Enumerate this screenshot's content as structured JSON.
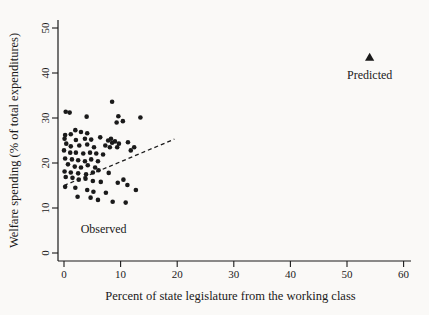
{
  "colors": {
    "background": "#faf9f7",
    "ink": "#1a1a1a"
  },
  "chart_data": {
    "type": "scatter",
    "title": "",
    "xlabel": "Percent of state legislature from the working class",
    "ylabel": "Welfare spending (% of total expenditures)",
    "xlim": [
      0,
      62
    ],
    "ylim": [
      0,
      52
    ],
    "x_ticks": [
      0,
      10,
      20,
      30,
      40,
      50,
      60
    ],
    "y_ticks": [
      0,
      10,
      20,
      30,
      40,
      50
    ],
    "grid": false,
    "legend_position": "none",
    "series": [
      {
        "name": "Observed",
        "marker": "circle",
        "color": "#1a1a1a",
        "points": [
          [
            8.5,
            33.6
          ],
          [
            13.5,
            30.1
          ],
          [
            0.3,
            31.4
          ],
          [
            1.0,
            31.2
          ],
          [
            4.0,
            30.3
          ],
          [
            9.6,
            30.4
          ],
          [
            10.4,
            29.3
          ],
          [
            9.3,
            29.0
          ],
          [
            2.0,
            27.3
          ],
          [
            3.0,
            26.9
          ],
          [
            0.2,
            26.2
          ],
          [
            1.2,
            26.4
          ],
          [
            4.1,
            26.6
          ],
          [
            0.1,
            25.4
          ],
          [
            2.1,
            25.1
          ],
          [
            3.7,
            25.4
          ],
          [
            4.8,
            25.2
          ],
          [
            6.4,
            25.7
          ],
          [
            8.3,
            25.4
          ],
          [
            9.0,
            24.8
          ],
          [
            7.8,
            25.0
          ],
          [
            8.5,
            24.5
          ],
          [
            9.7,
            24.3
          ],
          [
            11.3,
            24.6
          ],
          [
            12.4,
            23.5
          ],
          [
            11.8,
            22.8
          ],
          [
            0.4,
            24.3
          ],
          [
            1.2,
            23.7
          ],
          [
            2.7,
            23.9
          ],
          [
            4.1,
            24.1
          ],
          [
            5.3,
            23.5
          ],
          [
            7.3,
            23.9
          ],
          [
            8.1,
            23.5
          ],
          [
            9.4,
            23.5
          ],
          [
            0.0,
            22.8
          ],
          [
            1.1,
            22.3
          ],
          [
            2.1,
            22.3
          ],
          [
            3.4,
            22.1
          ],
          [
            4.6,
            22.3
          ],
          [
            5.7,
            22.1
          ],
          [
            6.9,
            21.9
          ],
          [
            0.2,
            21.0
          ],
          [
            1.4,
            20.8
          ],
          [
            2.5,
            20.6
          ],
          [
            3.7,
            20.4
          ],
          [
            4.8,
            20.8
          ],
          [
            6.0,
            20.4
          ],
          [
            0.7,
            19.7
          ],
          [
            1.9,
            19.2
          ],
          [
            3.0,
            19.0
          ],
          [
            4.2,
            19.5
          ],
          [
            5.5,
            19.0
          ],
          [
            0.1,
            18.1
          ],
          [
            1.2,
            17.9
          ],
          [
            2.5,
            17.7
          ],
          [
            3.9,
            17.5
          ],
          [
            5.1,
            17.9
          ],
          [
            6.1,
            18.4
          ],
          [
            7.9,
            17.8
          ],
          [
            0.3,
            16.9
          ],
          [
            1.5,
            16.7
          ],
          [
            2.6,
            16.3
          ],
          [
            3.8,
            16.5
          ],
          [
            5.1,
            16.0
          ],
          [
            6.5,
            15.8
          ],
          [
            9.5,
            15.6
          ],
          [
            10.5,
            16.3
          ],
          [
            11.2,
            15.1
          ],
          [
            0.2,
            14.7
          ],
          [
            2.0,
            14.5
          ],
          [
            4.1,
            14.0
          ],
          [
            5.2,
            13.6
          ],
          [
            7.4,
            13.4
          ],
          [
            12.7,
            14.0
          ],
          [
            2.4,
            12.5
          ],
          [
            4.7,
            12.3
          ],
          [
            6.0,
            11.8
          ],
          [
            8.6,
            11.4
          ],
          [
            10.9,
            11.2
          ]
        ]
      },
      {
        "name": "Predicted",
        "marker": "triangle",
        "color": "#1a1a1a",
        "points": [
          [
            54,
            43.5
          ]
        ]
      }
    ],
    "trend_line": {
      "style": "dashed",
      "color": "#1a1a1a",
      "from": [
        0,
        15.0
      ],
      "to": [
        19.5,
        25.3
      ]
    },
    "annotations": [
      {
        "text": "Observed",
        "x": 7.0,
        "y": 4.5
      },
      {
        "text": "Predicted",
        "x": 54.0,
        "y": 38.6
      }
    ]
  }
}
